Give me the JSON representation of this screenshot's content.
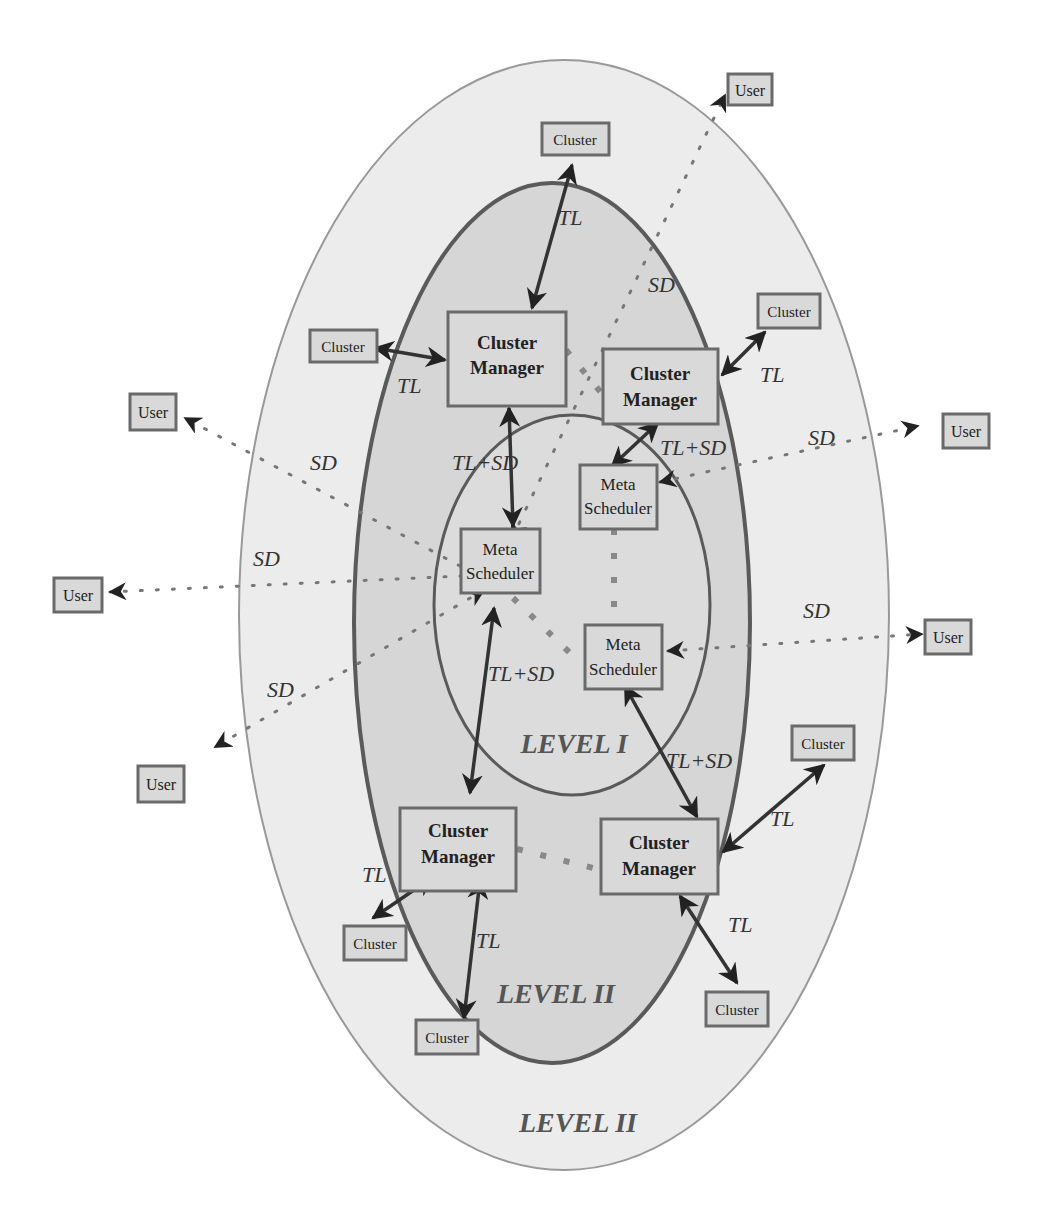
{
  "diagram": {
    "levels": {
      "outer": "LEVEL II",
      "middle": "LEVEL II",
      "inner": "LEVEL I"
    },
    "edge_labels": {
      "tl": "TL",
      "sd": "SD",
      "tlsd": "TL+SD"
    },
    "nodes": {
      "cluster_manager_line1": "Cluster",
      "cluster_manager_line2": "Manager",
      "meta_scheduler_line1": "Meta",
      "meta_scheduler_line2": "Scheduler",
      "cluster": "Cluster",
      "user": "User"
    },
    "colors": {
      "outer_fill": "#ececec",
      "middle_fill": "#d6d6d6",
      "inner_fill": "#dcdcdc",
      "stroke": "#5a5a5a"
    }
  }
}
